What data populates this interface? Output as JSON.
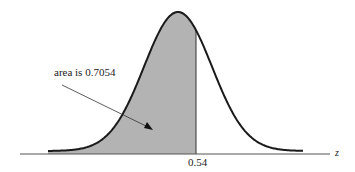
{
  "chart_data": {
    "type": "area",
    "title": "",
    "xlabel": "z",
    "ylabel": "",
    "distribution": "standard normal",
    "shaded_region": {
      "from": "-inf",
      "to": 0.54
    },
    "annotations": [
      {
        "text": "area is 0.7054",
        "points_to": "shaded region"
      }
    ],
    "tick_labels": [
      "0.54"
    ],
    "grid": false,
    "legend": null,
    "colors": {
      "curve": "#1a1a1a",
      "shade": "#b3b3b3",
      "axis": "#555555"
    }
  },
  "labels": {
    "annotation": "area is 0.7054",
    "tick": "0.54",
    "axis": "z"
  }
}
